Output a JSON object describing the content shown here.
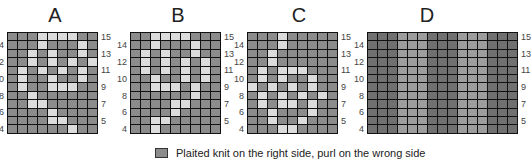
{
  "charts": [
    {
      "title": "A",
      "rows": [
        15,
        14,
        13,
        12,
        11,
        10,
        9,
        8,
        7,
        6,
        5,
        4
      ],
      "cols": 9,
      "pattern": [
        [
          0,
          0,
          0,
          1,
          1,
          1,
          1,
          0,
          0
        ],
        [
          0,
          0,
          0,
          1,
          0,
          0,
          0,
          1,
          0
        ],
        [
          0,
          0,
          1,
          0,
          1,
          0,
          0,
          1,
          0
        ],
        [
          0,
          0,
          1,
          0,
          1,
          0,
          1,
          0,
          1
        ],
        [
          0,
          1,
          0,
          1,
          0,
          1,
          0,
          1,
          0
        ],
        [
          0,
          1,
          0,
          0,
          1,
          0,
          0,
          1,
          0
        ],
        [
          0,
          1,
          0,
          0,
          1,
          1,
          1,
          0,
          0
        ],
        [
          0,
          0,
          1,
          0,
          0,
          0,
          0,
          0,
          0
        ],
        [
          0,
          0,
          1,
          1,
          0,
          0,
          0,
          0,
          0
        ],
        [
          0,
          0,
          0,
          0,
          1,
          0,
          0,
          0,
          0
        ],
        [
          0,
          0,
          0,
          0,
          1,
          1,
          0,
          0,
          0
        ],
        [
          0,
          0,
          0,
          0,
          0,
          0,
          1,
          0,
          0
        ]
      ],
      "left_labels": [
        "14",
        "12",
        "10",
        "8",
        "6",
        "4"
      ],
      "right_labels": [
        "15",
        "13",
        "11",
        "9",
        "7",
        "5"
      ]
    },
    {
      "title": "B",
      "rows": [
        15,
        14,
        13,
        12,
        11,
        10,
        9,
        8,
        7,
        6,
        5,
        4
      ],
      "cols": 9,
      "pattern": [
        [
          0,
          0,
          1,
          1,
          1,
          1,
          0,
          0,
          0
        ],
        [
          0,
          0,
          1,
          0,
          0,
          0,
          1,
          0,
          0
        ],
        [
          0,
          1,
          0,
          1,
          0,
          0,
          1,
          0,
          0
        ],
        [
          0,
          1,
          0,
          1,
          0,
          1,
          0,
          1,
          0
        ],
        [
          0,
          1,
          0,
          1,
          0,
          1,
          0,
          1,
          0
        ],
        [
          0,
          0,
          1,
          0,
          0,
          1,
          0,
          1,
          0
        ],
        [
          0,
          0,
          1,
          1,
          1,
          0,
          1,
          0,
          0
        ],
        [
          0,
          0,
          0,
          0,
          0,
          0,
          1,
          0,
          0
        ],
        [
          0,
          0,
          0,
          0,
          1,
          1,
          0,
          0,
          0
        ],
        [
          0,
          0,
          0,
          0,
          1,
          0,
          0,
          0,
          0
        ],
        [
          0,
          0,
          1,
          1,
          0,
          0,
          0,
          0,
          0
        ],
        [
          0,
          0,
          1,
          0,
          0,
          0,
          0,
          0,
          0
        ]
      ],
      "left_labels": [
        "14",
        "12",
        "10",
        "8",
        "6",
        "4"
      ],
      "right_labels": [
        "15",
        "13",
        "11",
        "9",
        "7",
        "5"
      ]
    },
    {
      "title": "C",
      "rows": [
        15,
        14,
        13,
        12,
        11,
        10,
        9,
        8,
        7,
        6,
        5,
        4
      ],
      "cols": 9,
      "pattern": [
        [
          0,
          0,
          0,
          1,
          0,
          0,
          0,
          0,
          0
        ],
        [
          0,
          0,
          0,
          1,
          0,
          0,
          0,
          0,
          0
        ],
        [
          0,
          0,
          1,
          0,
          0,
          0,
          0,
          0,
          0
        ],
        [
          0,
          0,
          1,
          0,
          0,
          0,
          0,
          0,
          0
        ],
        [
          0,
          1,
          0,
          1,
          1,
          1,
          0,
          0,
          0
        ],
        [
          0,
          1,
          0,
          1,
          0,
          0,
          1,
          0,
          0
        ],
        [
          1,
          0,
          1,
          0,
          1,
          0,
          1,
          0,
          0
        ],
        [
          0,
          1,
          0,
          1,
          0,
          1,
          0,
          1,
          0
        ],
        [
          0,
          1,
          0,
          1,
          1,
          0,
          1,
          0,
          0
        ],
        [
          0,
          0,
          1,
          0,
          0,
          0,
          1,
          0,
          0
        ],
        [
          0,
          0,
          1,
          0,
          0,
          1,
          0,
          0,
          0
        ],
        [
          0,
          0,
          0,
          1,
          1,
          0,
          0,
          0,
          0
        ]
      ],
      "left_labels": [
        "14",
        "12",
        "10",
        "8",
        "6",
        "4"
      ],
      "right_labels": [
        "15",
        "13",
        "11",
        "9",
        "7",
        "5"
      ]
    },
    {
      "title": "D",
      "rows": [
        15,
        14,
        13,
        12,
        11,
        10,
        9,
        8,
        7,
        6,
        5,
        4
      ],
      "cols": 15,
      "column_shading": [
        "dark",
        "dark",
        "dark",
        "mid",
        "mid",
        "mid",
        "dark",
        "dark",
        "dark",
        "mid",
        "mid",
        "mid",
        "dark",
        "dark",
        "dark"
      ],
      "left_labels": [
        "14",
        "12",
        "10",
        "8",
        "6",
        "4"
      ],
      "right_labels": [
        "15",
        "13",
        "11",
        "9",
        "7",
        "5"
      ]
    }
  ],
  "legend": {
    "label": "Plaited knit on the right side, purl on the wrong side",
    "swatch_color": "#8c8c8c"
  },
  "colors": {
    "base": "#8c8c8c",
    "light": "#dcdcdc",
    "dark": "#707070",
    "mid": "#9d9d9d",
    "gridline": "#111111"
  }
}
